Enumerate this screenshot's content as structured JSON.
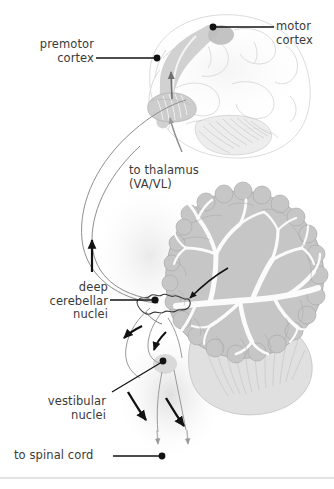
{
  "figure": {
    "background_color": "#ffffff",
    "text_color": "#3a3a3a",
    "leader_color": "#1a1a1a"
  },
  "labels": {
    "premotor_cortex": {
      "line1": "premotor",
      "line2": "cortex"
    },
    "motor_cortex": {
      "line1": "motor",
      "line2": "cortex"
    },
    "to_thalamus": {
      "line1": "to thalamus",
      "line2": "(VA/VL)"
    },
    "deep_cerebellar_nuclei": {
      "line1": "deep",
      "line2": "cerebellar",
      "line3": "nuclei"
    },
    "vestibular_nuclei": {
      "line1": "vestibular",
      "line2": "nuclei"
    },
    "to_spinal_cord": {
      "line1": "to spinal cord"
    }
  },
  "anatomy": {
    "brain_outline": "brain-lateral-outline",
    "motor_strip": "precentral-gyrus-shaded",
    "premotor_strip": "premotor-area-shaded",
    "thalamus": "thalamus-shaded",
    "cerebellum": "cerebellum-arbor-vitae",
    "dentate_nucleus": "deep-cerebellar-nuclei",
    "vestibular_nuclei": "vestibular-nuclei",
    "brainstem": "brainstem-medulla"
  },
  "colors": {
    "faint_outline": "#d8d8d8",
    "shade_light": "#e3e3e3",
    "shade_mid": "#c9c9c9",
    "shade_dark": "#b0b0b0",
    "arrow_black": "#121212",
    "pathway_gray": "#8a8a8a",
    "footer_rule": "#c8c8c8"
  }
}
